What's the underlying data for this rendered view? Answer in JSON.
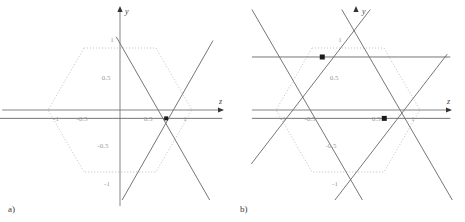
{
  "figure": {
    "width": 465,
    "height": 222,
    "background": "#ffffff",
    "panels": [
      {
        "id": "panel-a",
        "label": "a)",
        "label_pos": [
          8,
          212
        ],
        "origin": [
          120,
          110
        ],
        "scale": [
          62,
          62
        ],
        "axes": {
          "x": {
            "name": "z",
            "name_pos": [
              219,
              104
            ],
            "arrow_to": [
              224,
              110
            ],
            "line_from": [
              -1.9,
              0
            ],
            "line_to": [
              1.63,
              0
            ],
            "ticks": [
              {
                "value": -1,
                "label": "-1",
                "pos": [
                  56,
                  121
                ]
              },
              {
                "value": -0.5,
                "label": "-0.5",
                "pos": [
                  82,
                  121
                ]
              },
              {
                "value": 0.5,
                "label": "0.5",
                "pos": [
                  148,
                  121
                ]
              },
              {
                "value": 1,
                "label": "1",
                "pos": [
                  185,
                  121
                ]
              }
            ]
          },
          "y": {
            "name": "y",
            "name_pos": [
              125,
              14
            ],
            "arrow_to": [
              120,
              6
            ],
            "line_from": [
              0,
              -1.55
            ],
            "line_to": [
              0,
              1.63
            ],
            "ticks": [
              {
                "value": 1,
                "label": "1",
                "pos": [
                  112,
                  42
                ]
              },
              {
                "value": 0.5,
                "label": "0.5",
                "pos": [
                  106,
                  80
                ]
              },
              {
                "value": -0.5,
                "label": "-0.5",
                "pos": [
                  103,
                  148
                ]
              },
              {
                "value": -1,
                "label": "-1",
                "pos": [
                  107,
                  186
                ]
              }
            ]
          }
        },
        "hexagon": {
          "color": "#b9b9b9",
          "dash": "1,2",
          "vertices": [
            [
              -0.58,
              1.0
            ],
            [
              0.58,
              1.0
            ],
            [
              1.16,
              0.0
            ],
            [
              0.58,
              -1.0
            ],
            [
              -0.58,
              -1.0
            ],
            [
              -1.16,
              0.0
            ]
          ]
        },
        "lines": [
          {
            "name": "line-horizontal-low",
            "color": "#666666",
            "from": [
              -1.95,
              -0.135
            ],
            "to": [
              1.65,
              -0.135
            ]
          },
          {
            "name": "line-negative-slope",
            "color": "#666666",
            "from": [
              -0.06,
              1.18
            ],
            "to": [
              1.52,
              -1.58
            ]
          },
          {
            "name": "line-positive-slope",
            "color": "#666666",
            "from": [
              -0.05,
              -1.6
            ],
            "to": [
              1.5,
              1.12
            ]
          }
        ],
        "markers": [
          {
            "name": "intersection-point",
            "at": [
              0.745,
              -0.135
            ],
            "color": "#1c1c1c",
            "size": 4
          }
        ]
      },
      {
        "id": "panel-b",
        "label": "b)",
        "label_pos": [
          240,
          212
        ],
        "origin": [
          348,
          110
        ],
        "scale": [
          62,
          62
        ],
        "axes": {
          "x": {
            "name": "z",
            "name_pos": [
              447,
              104
            ],
            "arrow_to": [
              452,
              110
            ],
            "line_from": [
              -1.55,
              0
            ],
            "line_to": [
              1.65,
              0
            ],
            "ticks": [
              {
                "value": -1,
                "label": "-1",
                "pos": [
                  283,
                  121
                ]
              },
              {
                "value": -0.5,
                "label": "-0.5",
                "pos": [
                  310,
                  121
                ]
              },
              {
                "value": 0.5,
                "label": "0.5",
                "pos": [
                  376,
                  121
                ]
              },
              {
                "value": 1,
                "label": "1",
                "pos": [
                  413,
                  121
                ]
              }
            ]
          },
          "y": {
            "name": "y",
            "name_pos": [
              362,
              14
            ],
            "arrow_to": [
              356,
              6
            ],
            "line_from": [
              0,
              0
            ],
            "line_to": [
              0,
              0
            ],
            "ticks": [
              {
                "value": 1,
                "label": "1",
                "pos": [
                  340,
                  42
                ]
              },
              {
                "value": 0.5,
                "label": "0.5",
                "pos": [
                  334,
                  80
                ]
              },
              {
                "value": -0.5,
                "label": "-0.5",
                "pos": [
                  331,
                  148
                ]
              },
              {
                "value": -1,
                "label": "-1",
                "pos": [
                  335,
                  186
                ]
              }
            ]
          }
        },
        "hexagon": {
          "color": "#b9b9b9",
          "dash": "1,2",
          "vertices": [
            [
              -0.58,
              1.0
            ],
            [
              0.58,
              1.0
            ],
            [
              1.16,
              0.0
            ],
            [
              0.58,
              -1.0
            ],
            [
              -0.58,
              -1.0
            ],
            [
              -1.16,
              0.0
            ]
          ]
        },
        "lines": [
          {
            "name": "line-horizontal-upper",
            "color": "#666666",
            "from": [
              -1.55,
              0.855
            ],
            "to": [
              1.65,
              0.855
            ]
          },
          {
            "name": "line-horizontal-lower",
            "color": "#666666",
            "from": [
              -1.55,
              -0.135
            ],
            "to": [
              1.65,
              -0.135
            ]
          },
          {
            "name": "line-neg-slope-1",
            "color": "#666666",
            "from": [
              -1.55,
              1.62
            ],
            "to": [
              0.33,
              -1.62
            ]
          },
          {
            "name": "line-neg-slope-2",
            "color": "#666666",
            "from": [
              -0.1,
              1.62
            ],
            "to": [
              1.78,
              -1.62
            ]
          },
          {
            "name": "line-pos-slope-1",
            "color": "#666666",
            "from": [
              -1.56,
              -0.87
            ],
            "to": [
              0.36,
              1.62
            ]
          },
          {
            "name": "line-pos-slope-2",
            "color": "#666666",
            "from": [
              -0.34,
              -1.62
            ],
            "to": [
              1.6,
              0.9
            ]
          }
        ],
        "markers": [
          {
            "name": "intersection-point-upper",
            "at": [
              -0.415,
              0.855
            ],
            "color": "#1c1c1c",
            "size": 5
          },
          {
            "name": "intersection-point-lower",
            "at": [
              0.585,
              -0.135
            ],
            "color": "#1c1c1c",
            "size": 5
          }
        ]
      }
    ]
  }
}
